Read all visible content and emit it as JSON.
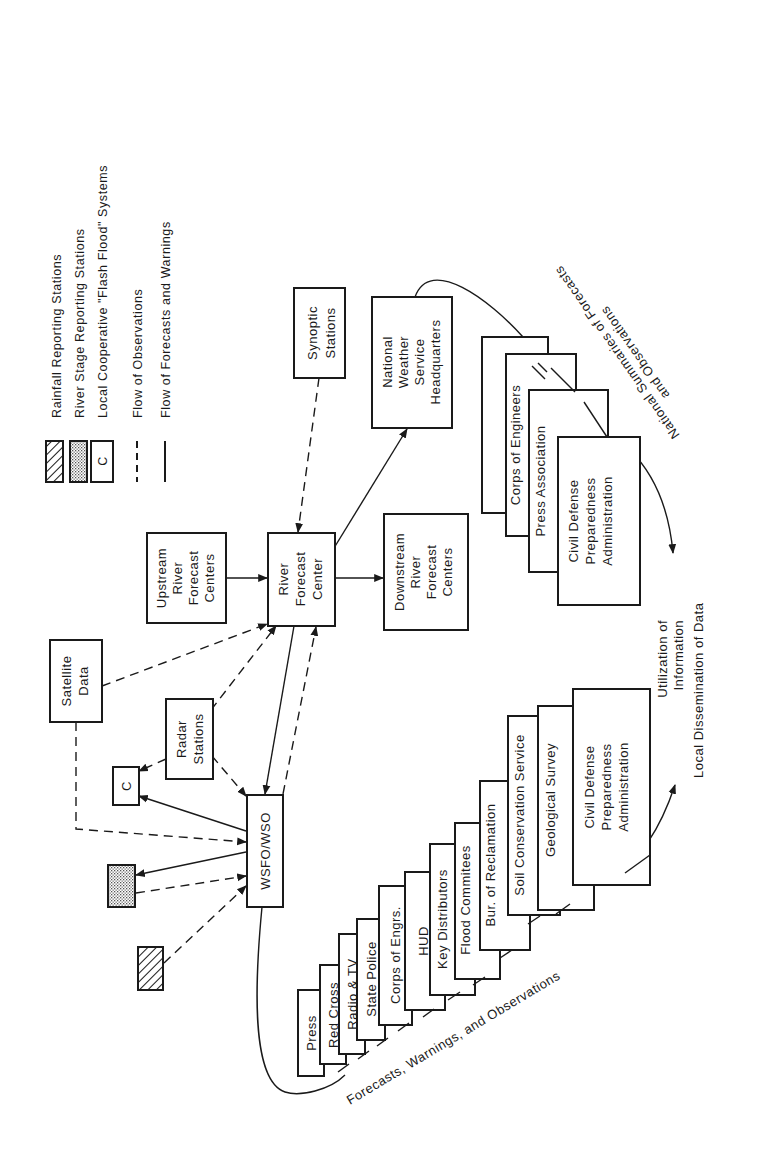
{
  "legend": {
    "items": [
      {
        "symbol": "hatched-box",
        "label": "Rainfall Reporting Stations"
      },
      {
        "symbol": "dotted-box",
        "label": "River Stage Reporting Stations"
      },
      {
        "symbol": "c-box",
        "label": "Local Cooperative \"Flash Flood\" Systems",
        "glyph": "C"
      },
      {
        "symbol": "dashed-line",
        "label": "Flow of Observations"
      },
      {
        "symbol": "solid-line",
        "label": "Flow of Forecasts and Warnings"
      }
    ]
  },
  "nodes": {
    "synoptic": [
      "Synoptic",
      "Stations"
    ],
    "nws_hq": [
      "National",
      "Weather",
      "Service",
      "Headquarters"
    ],
    "upstream": [
      "Upstream",
      "River",
      "Forecast",
      "Centers"
    ],
    "rfc": [
      "River",
      "Forecast",
      "Center"
    ],
    "downstream": [
      "Downstream",
      "River",
      "Forecast",
      "Centers"
    ],
    "satellite": [
      "Satellite",
      "Data"
    ],
    "radar": [
      "Radar",
      "Stations"
    ],
    "local_c": "C",
    "wsfo": "WSFO/WSO"
  },
  "national_stack": {
    "items": [
      [
        "Red Cross"
      ],
      [
        "Corps of Engineers"
      ],
      [
        "Press Association"
      ],
      [
        "Civil Defense",
        "Preparedness",
        "Administration"
      ]
    ],
    "caption_lines": [
      "National Summaries of Forecasts",
      "and Observations"
    ]
  },
  "local_stack": {
    "items": [
      [
        "Press"
      ],
      [
        "Red Cross"
      ],
      [
        "Radio & TV"
      ],
      [
        "State Police"
      ],
      [
        "Corps of Engrs."
      ],
      [
        "HUD"
      ],
      [
        "Key Distributors"
      ],
      [
        "Flood Commitees"
      ],
      [
        "Bur. of Reclamation"
      ],
      [
        "Soil Conservation Service"
      ],
      [
        "Geological Survey"
      ],
      [
        "Civil Defense",
        "Preparedness",
        "Administration"
      ]
    ],
    "caption": "Forecasts, Warnings, and Observations"
  },
  "outcome": {
    "lines": [
      "Utilization of",
      "Information",
      "Local Dissemination of Data"
    ]
  }
}
